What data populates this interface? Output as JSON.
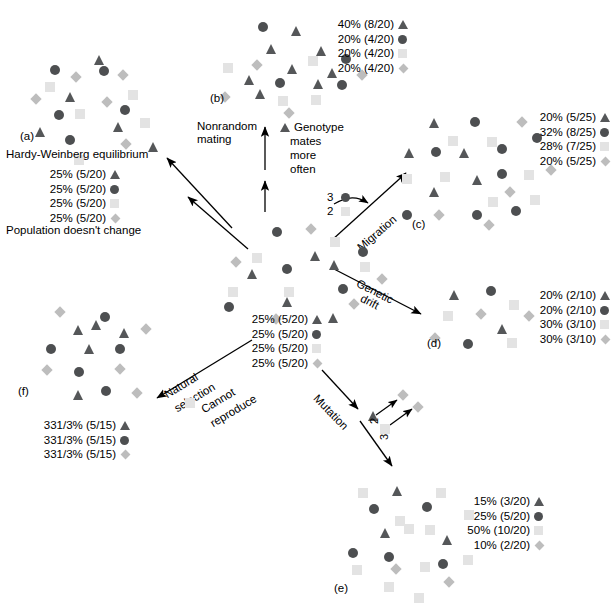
{
  "figure": {
    "title_a": "Hardy-Weinberg equilibrium",
    "caption_a": "Population doesn't change"
  },
  "colors": {
    "triangle": "#555759",
    "circle": "#4d4f51",
    "square": "#e3e3e3",
    "diamond": "#bdbdbd",
    "arrow": "#000000",
    "background": "#ffffff"
  },
  "panels": [
    {
      "id": "(a)",
      "name": "hardy-weinberg-equilibrium",
      "title": "Hardy-Weinberg equilibrium",
      "caption": "Population doesn't change",
      "legend": [
        {
          "pct": "25% (5/20)",
          "shape": "triangle"
        },
        {
          "pct": "25% (5/20)",
          "shape": "circle"
        },
        {
          "pct": "25% (5/20)",
          "shape": "square"
        },
        {
          "pct": "25% (5/20)",
          "shape": "diamond"
        }
      ]
    },
    {
      "id": "(b)",
      "name": "nonrandom-mating",
      "legend": [
        {
          "pct": "40% (8/20)",
          "shape": "triangle"
        },
        {
          "pct": "20% (4/20)",
          "shape": "circle"
        },
        {
          "pct": "20% (4/20)",
          "shape": "square"
        },
        {
          "pct": "20% (4/20)",
          "shape": "diamond"
        }
      ]
    },
    {
      "id": "(c)",
      "name": "migration",
      "legend": [
        {
          "pct": "20% (5/25)",
          "shape": "triangle"
        },
        {
          "pct": "32% (8/25)",
          "shape": "circle"
        },
        {
          "pct": "28% (7/25)",
          "shape": "square"
        },
        {
          "pct": "20% (5/25)",
          "shape": "diamond"
        }
      ]
    },
    {
      "id": "(d)",
      "name": "genetic-drift",
      "legend": [
        {
          "pct": "20% (2/10)",
          "shape": "triangle"
        },
        {
          "pct": "20% (2/10)",
          "shape": "circle"
        },
        {
          "pct": "30% (3/10)",
          "shape": "square"
        },
        {
          "pct": "30% (3/10)",
          "shape": "diamond"
        }
      ]
    },
    {
      "id": "(e)",
      "name": "mutation",
      "legend": [
        {
          "pct": "15% (3/20)",
          "shape": "triangle"
        },
        {
          "pct": "25% (5/20)",
          "shape": "circle"
        },
        {
          "pct": "50% (10/20)",
          "shape": "square"
        },
        {
          "pct": "10% (2/20)",
          "shape": "diamond"
        }
      ]
    },
    {
      "id": "(f)",
      "name": "natural-selection",
      "legend": [
        {
          "pct": "331/3% (5/15)",
          "shape": "triangle"
        },
        {
          "pct": "331/3% (5/15)",
          "shape": "circle"
        },
        {
          "pct": "331/3% (5/15)",
          "shape": "diamond"
        }
      ]
    },
    {
      "id": "",
      "name": "starting-population",
      "legend": [
        {
          "pct": "25% (5/20)",
          "shape": "triangle"
        },
        {
          "pct": "25% (5/20)",
          "shape": "circle"
        },
        {
          "pct": "25% (5/20)",
          "shape": "square"
        },
        {
          "pct": "25% (5/20)",
          "shape": "diamond"
        }
      ]
    }
  ],
  "arrow_labels": {
    "nonrandom_mating": "Nonrandom\nmating",
    "genotype_note_line1": "Genotype",
    "genotype_note_line2": "mates",
    "genotype_note_line3": "more",
    "genotype_note_line4": "often",
    "migration": "Migration",
    "genetic_drift_line1": "Genetic",
    "genetic_drift_line2": "drift",
    "mutation": "Mutation",
    "natural_selection_line1": "Natural",
    "natural_selection_line2": "selection",
    "cannot_reproduce_line1": "Cannot",
    "cannot_reproduce_line2": "reproduce"
  },
  "migration_detail": {
    "count_circle": "3",
    "count_square": "2"
  },
  "mutation_detail": {
    "count_triangle": "2",
    "count_square": "3"
  },
  "chart_data": {
    "type": "diagram",
    "populations": {
      "start": {
        "triangle": 5,
        "circle": 5,
        "square": 5,
        "diamond": 5,
        "total": 20
      },
      "a": {
        "triangle": 5,
        "circle": 5,
        "square": 5,
        "diamond": 5,
        "total": 20
      },
      "b": {
        "triangle": 8,
        "circle": 4,
        "square": 4,
        "diamond": 4,
        "total": 20
      },
      "c": {
        "triangle": 5,
        "circle": 8,
        "square": 7,
        "diamond": 5,
        "total": 25
      },
      "d": {
        "triangle": 2,
        "circle": 2,
        "square": 3,
        "diamond": 3,
        "total": 10
      },
      "e": {
        "triangle": 3,
        "circle": 5,
        "square": 10,
        "diamond": 2,
        "total": 20
      },
      "f": {
        "triangle": 5,
        "circle": 5,
        "square": 0,
        "diamond": 5,
        "total": 15
      }
    },
    "shape_positions": {
      "a": [
        [
          38,
          40,
          "cir"
        ],
        [
          82,
          30,
          "tri"
        ],
        [
          60,
          48,
          "dia"
        ],
        [
          87,
          41,
          "cir"
        ],
        [
          107,
          46,
          "dia"
        ],
        [
          33,
          57,
          "sqr"
        ],
        [
          116,
          65,
          "sqr"
        ],
        [
          20,
          70,
          "dia"
        ],
        [
          53,
          67,
          "tri"
        ],
        [
          91,
          73,
          "dia"
        ],
        [
          42,
          85,
          "cir"
        ],
        [
          63,
          84,
          "sqr"
        ],
        [
          108,
          80,
          "cir"
        ],
        [
          23,
          102,
          "tri"
        ],
        [
          101,
          97,
          "tri"
        ],
        [
          128,
          93,
          "sqr"
        ],
        [
          53,
          110,
          "cir"
        ],
        [
          110,
          115,
          "dia"
        ],
        [
          136,
          117,
          "tri"
        ],
        [
          62,
          130,
          "sqr"
        ]
      ],
      "b": [
        [
          43,
          10,
          "cir"
        ],
        [
          76,
          14,
          "tri"
        ],
        [
          51,
          32,
          "tri"
        ],
        [
          101,
          34,
          "tri"
        ],
        [
          126,
          42,
          "cir"
        ],
        [
          8,
          51,
          "sqr"
        ],
        [
          38,
          49,
          "dia"
        ],
        [
          72,
          52,
          "tri"
        ],
        [
          93,
          44,
          "sqr"
        ],
        [
          112,
          56,
          "tri"
        ],
        [
          143,
          59,
          "dia"
        ],
        [
          29,
          63,
          "tri"
        ],
        [
          60,
          66,
          "cir"
        ],
        [
          98,
          67,
          "tri"
        ],
        [
          122,
          68,
          "cir"
        ],
        [
          6,
          81,
          "dia"
        ],
        [
          40,
          77,
          "tri"
        ],
        [
          63,
          84,
          "sqr"
        ],
        [
          96,
          83,
          "sqr"
        ],
        [
          70,
          97,
          "dia"
        ]
      ],
      "c": [
        [
          33,
          6,
          "tri"
        ],
        [
          74,
          5,
          "cir"
        ],
        [
          122,
          6,
          "dia"
        ],
        [
          52,
          24,
          "sqr"
        ],
        [
          91,
          25,
          "sqr"
        ],
        [
          136,
          21,
          "cir"
        ],
        [
          8,
          36,
          "tri"
        ],
        [
          35,
          35,
          "cir"
        ],
        [
          63,
          36,
          "tri"
        ],
        [
          101,
          32,
          "cir"
        ],
        [
          6,
          62,
          "sqr"
        ],
        [
          44,
          60,
          "sqr"
        ],
        [
          76,
          63,
          "tri"
        ],
        [
          101,
          57,
          "cir"
        ],
        [
          128,
          58,
          "sqr"
        ],
        [
          151,
          54,
          "dia"
        ],
        [
          33,
          75,
          "tri"
        ],
        [
          110,
          76,
          "dia"
        ],
        [
          92,
          85,
          "sqr"
        ],
        [
          134,
          83,
          "sqr"
        ],
        [
          6,
          98,
          "cir"
        ],
        [
          39,
          99,
          "dia"
        ],
        [
          76,
          98,
          "cir"
        ],
        [
          115,
          94,
          "cir"
        ],
        [
          89,
          109,
          "dia"
        ]
      ],
      "d": [
        [
          24,
          8,
          "tri"
        ],
        [
          61,
          4,
          "cir"
        ],
        [
          84,
          18,
          "sqr"
        ],
        [
          18,
          29,
          "sqr"
        ],
        [
          52,
          28,
          "dia"
        ],
        [
          100,
          30,
          "dia"
        ],
        [
          72,
          42,
          "tri"
        ],
        [
          6,
          52,
          "dia"
        ],
        [
          38,
          57,
          "cir"
        ],
        [
          82,
          56,
          "sqr"
        ]
      ],
      "e": [
        [
          18,
          8,
          "sqr"
        ],
        [
          52,
          6,
          "tri"
        ],
        [
          96,
          8,
          "sqr"
        ],
        [
          29,
          24,
          "cir"
        ],
        [
          82,
          22,
          "cir"
        ],
        [
          124,
          30,
          "sqr"
        ],
        [
          55,
          36,
          "sqr"
        ],
        [
          85,
          45,
          "sqr"
        ],
        [
          40,
          48,
          "tri"
        ],
        [
          64,
          44,
          "sqr"
        ],
        [
          102,
          55,
          "tri"
        ],
        [
          8,
          68,
          "cir"
        ],
        [
          44,
          72,
          "cir"
        ],
        [
          123,
          75,
          "sqr"
        ],
        [
          12,
          85,
          "sqr"
        ],
        [
          80,
          82,
          "sqr"
        ],
        [
          98,
          79,
          "cir"
        ],
        [
          52,
          85,
          "dia"
        ],
        [
          105,
          98,
          "dia"
        ],
        [
          44,
          102,
          "sqr"
        ],
        [
          74,
          113,
          "sqr"
        ]
      ],
      "f": [
        [
          18,
          6,
          "dia"
        ],
        [
          62,
          10,
          "cir"
        ],
        [
          35,
          23,
          "tri"
        ],
        [
          53,
          18,
          "tri"
        ],
        [
          81,
          26,
          "tri"
        ],
        [
          104,
          23,
          "dia"
        ],
        [
          8,
          42,
          "cir"
        ],
        [
          46,
          42,
          "tri"
        ],
        [
          77,
          42,
          "cir"
        ],
        [
          5,
          64,
          "dia"
        ],
        [
          36,
          65,
          "cir"
        ],
        [
          78,
          63,
          "dia"
        ],
        [
          35,
          88,
          "tri"
        ],
        [
          63,
          84,
          "cir"
        ],
        [
          95,
          87,
          "dia"
        ]
      ],
      "start": [
        [
          32,
          12,
          "cir"
        ],
        [
          67,
          10,
          "dia"
        ],
        [
          90,
          22,
          "sqr"
        ],
        [
          12,
          38,
          "sqr"
        ],
        [
          70,
          36,
          "tri"
        ],
        [
          118,
          32,
          "cir"
        ],
        [
          -8,
          43,
          "dia"
        ],
        [
          42,
          49,
          "cir"
        ],
        [
          89,
          45,
          "tri"
        ],
        [
          120,
          47,
          "sqr"
        ],
        [
          7,
          54,
          "tri"
        ],
        [
          138,
          60,
          "dia"
        ],
        [
          -12,
          72,
          "sqr"
        ],
        [
          44,
          72,
          "sqr"
        ],
        [
          98,
          69,
          "cir"
        ],
        [
          -16,
          87,
          "cir"
        ],
        [
          42,
          82,
          "tri"
        ],
        [
          110,
          85,
          "dia"
        ],
        [
          88,
          98,
          "tri"
        ],
        [
          32,
          100,
          "dia"
        ]
      ]
    }
  }
}
